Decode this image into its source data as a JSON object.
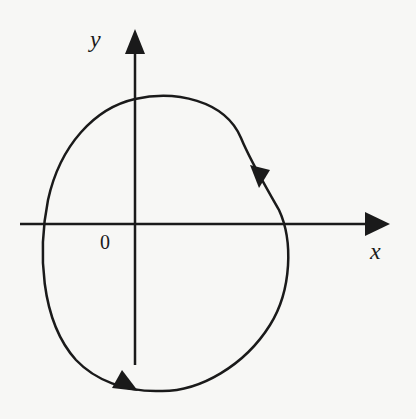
{
  "diagram": {
    "axes": {
      "x_label": "x",
      "y_label": "y",
      "origin_label": "0"
    },
    "curve": {
      "type": "closed-orbit",
      "direction": "clockwise",
      "arrow_markers": 2,
      "color": "#1a1a1a"
    },
    "colors": {
      "background": "#f7f7f5",
      "ink": "#1a1a1a"
    }
  }
}
